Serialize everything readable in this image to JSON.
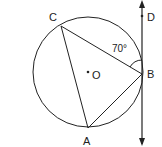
{
  "diagram": {
    "title": "",
    "circle": {
      "center_label": "O",
      "cx": 88,
      "cy": 72,
      "r": 55
    },
    "points": {
      "A": {
        "label": "A",
        "x": 88,
        "y": 128
      },
      "B": {
        "label": "B",
        "x": 142,
        "y": 74
      },
      "C": {
        "label": "C",
        "x": 61,
        "y": 26
      },
      "D": {
        "label": "D",
        "x": 142,
        "y": 16
      },
      "O": {
        "label": "O",
        "x": 88,
        "y": 72
      }
    },
    "angle": {
      "label": "70°",
      "vertex": "B",
      "between": [
        "C",
        "D"
      ]
    },
    "tangent_line": {
      "through": "B",
      "direction": "vertical",
      "arrows": "both"
    },
    "segments": [
      "CA",
      "CB",
      "AB"
    ],
    "colors": {
      "stroke": "#222222",
      "background": "#ffffff"
    }
  }
}
